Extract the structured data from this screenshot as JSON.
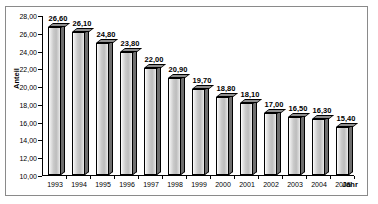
{
  "chart_data": {
    "type": "bar",
    "title": "",
    "xlabel": "Jahr",
    "ylabel": "Anteil",
    "categories": [
      "1993",
      "1994",
      "1995",
      "1996",
      "1997",
      "1998",
      "1999",
      "2000",
      "2001",
      "2002",
      "2003",
      "2004",
      "2005"
    ],
    "values": [
      26.6,
      26.1,
      24.8,
      23.8,
      22.0,
      20.9,
      19.7,
      18.8,
      18.1,
      17.0,
      16.5,
      16.3,
      15.4
    ],
    "value_labels": [
      "26,60",
      "26,10",
      "24,80",
      "23,80",
      "22,00",
      "20,90",
      "19,70",
      "18,80",
      "18,10",
      "17,00",
      "16,50",
      "16,30",
      "15,40"
    ],
    "ylim": [
      10.0,
      28.0
    ],
    "ytick_step": 2.0,
    "ytick_values": [
      28.0,
      26.0,
      24.0,
      22.0,
      20.0,
      18.0,
      16.0,
      14.0,
      12.0,
      10.0
    ],
    "ytick_labels": [
      "28,00",
      "26,00",
      "24,00",
      "22,00",
      "20,00",
      "18,00",
      "16,00",
      "14,00",
      "12,00",
      "10,00"
    ],
    "grid": false,
    "legend": null,
    "decimal_separator": ",",
    "style": "3d-column",
    "colors": {
      "bar_face": "#c9c9c9",
      "bar_side": "#6e6e6e",
      "bar_top": "#8d8d8d",
      "axis": "#000000",
      "frame": "#8a8a8a",
      "background": "#ffffff",
      "text": "#000000"
    }
  }
}
